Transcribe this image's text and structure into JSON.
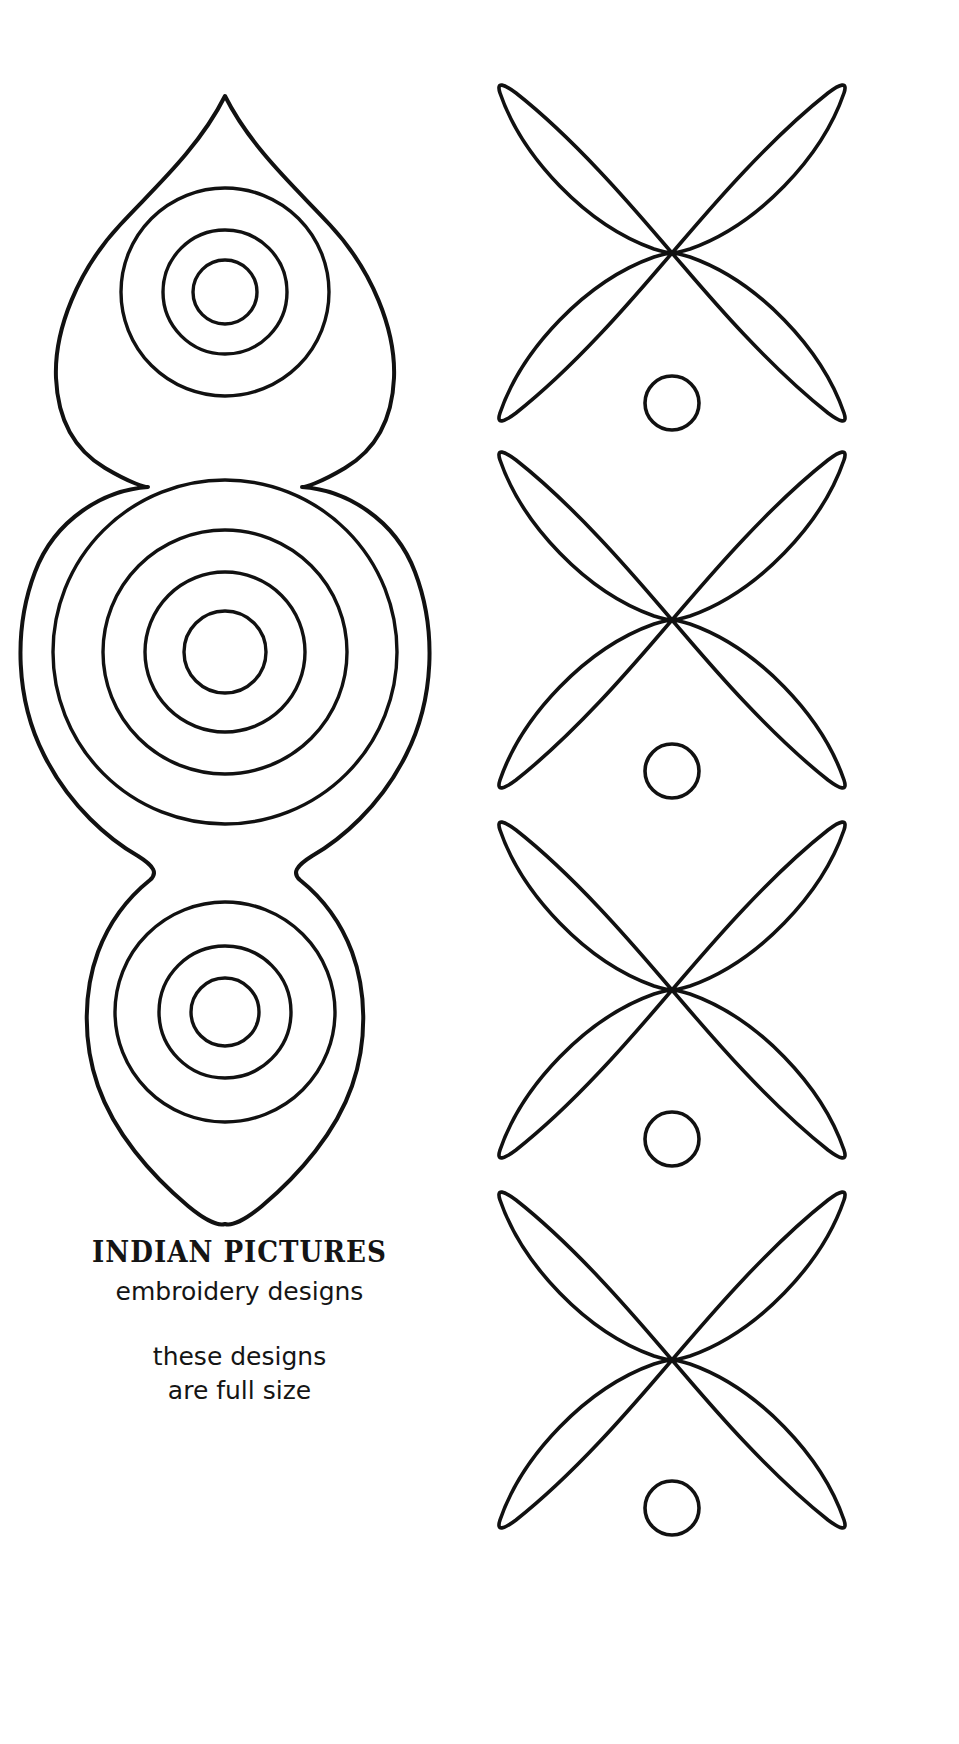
{
  "page": {
    "width": 959,
    "height": 1744,
    "background_color": "#ffffff",
    "ink_color": "#111111",
    "document_type": "embroidery-design-pattern-sheet"
  },
  "caption": {
    "title": "INDIAN PICTURES",
    "subtitle": "embroidery designs",
    "note_line_1": "these designs",
    "note_line_2": "are full size"
  },
  "left_motif": {
    "name": "paisley-ogee-chain",
    "units": [
      {
        "id": "top-teardrop",
        "shape": "teardrop-point-up",
        "apex": [
          225,
          96
        ],
        "center": [
          225,
          292
        ],
        "concentric_circles": 3,
        "circle_radii": [
          104,
          62,
          32
        ]
      },
      {
        "id": "middle-round",
        "shape": "round-lobe",
        "center": [
          225,
          652
        ],
        "concentric_circles": 4,
        "circle_radii": [
          172,
          122,
          80,
          41
        ]
      },
      {
        "id": "bottom-teardrop",
        "shape": "teardrop-point-down",
        "apex": [
          225,
          1224
        ],
        "center": [
          225,
          1012
        ],
        "concentric_circles": 3,
        "circle_radii": [
          110,
          66,
          34
        ]
      }
    ]
  },
  "right_motif": {
    "name": "four-petal-leaf-chain",
    "repeat_count": 4,
    "petals_per_unit": 4,
    "unit_centers_y": [
      253,
      620,
      990,
      1360
    ],
    "dot_centers_y": [
      403,
      771,
      1139,
      1508
    ],
    "center_x": 672,
    "dot_radius": 27,
    "petal_half_length": 172,
    "petal_half_width": 46
  },
  "colors": {
    "ink": "#111111",
    "paper": "#ffffff",
    "text": "#151515"
  }
}
